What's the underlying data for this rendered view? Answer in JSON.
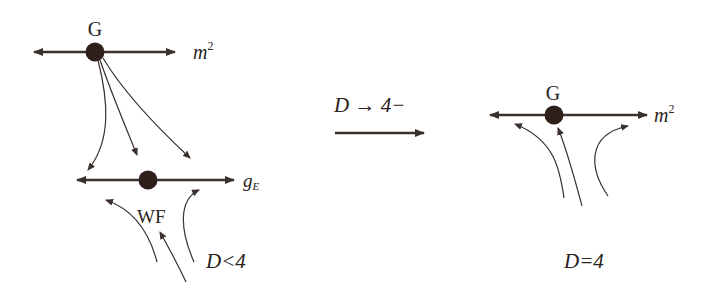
{
  "diagram": {
    "left_panel": {
      "upper_fixed_point": {
        "label": "G"
      },
      "upper_axis": {
        "label": "m",
        "superscript": "2"
      },
      "lower_fixed_point": {
        "label": "WF"
      },
      "lower_axis": {
        "label": "g",
        "subscript": "E"
      },
      "condition": {
        "label": "D<4"
      }
    },
    "transition": {
      "label": "D → 4−"
    },
    "right_panel": {
      "fixed_point": {
        "label": "G"
      },
      "axis": {
        "label": "m",
        "superscript": "2"
      },
      "condition": {
        "label": "D=4"
      }
    },
    "colors": {
      "ink": "#3a302c",
      "fixed_point": "#2e1f1b",
      "background": "#ffffff"
    }
  }
}
